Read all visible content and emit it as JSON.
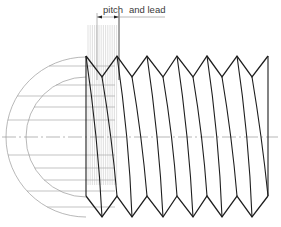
{
  "labels": {
    "pitch": "pitch",
    "and_lead": "and lead"
  },
  "colors": {
    "ink": "#1e1e1e",
    "construction": "#9a9a9a",
    "hatch": "#b0b0b0",
    "background": "#ffffff"
  },
  "geometry": {
    "axis_y": 137,
    "thread_left_x": 86,
    "thread_right_x": 268,
    "top_crest_y": 56,
    "top_root_y": 77,
    "bottom_crest_y": 196,
    "bottom_root_y": 217,
    "crests_x": [
      86,
      117,
      147,
      177,
      207,
      237,
      268
    ],
    "roots_x": [
      102,
      132,
      163,
      193,
      222,
      252
    ],
    "arc_center": [
      86,
      137
    ],
    "outer_radius": 80,
    "inner_radius": 60,
    "pitch_dim": {
      "y": 17,
      "x1": 97,
      "x2": 119,
      "ext_to_x": 165
    }
  }
}
